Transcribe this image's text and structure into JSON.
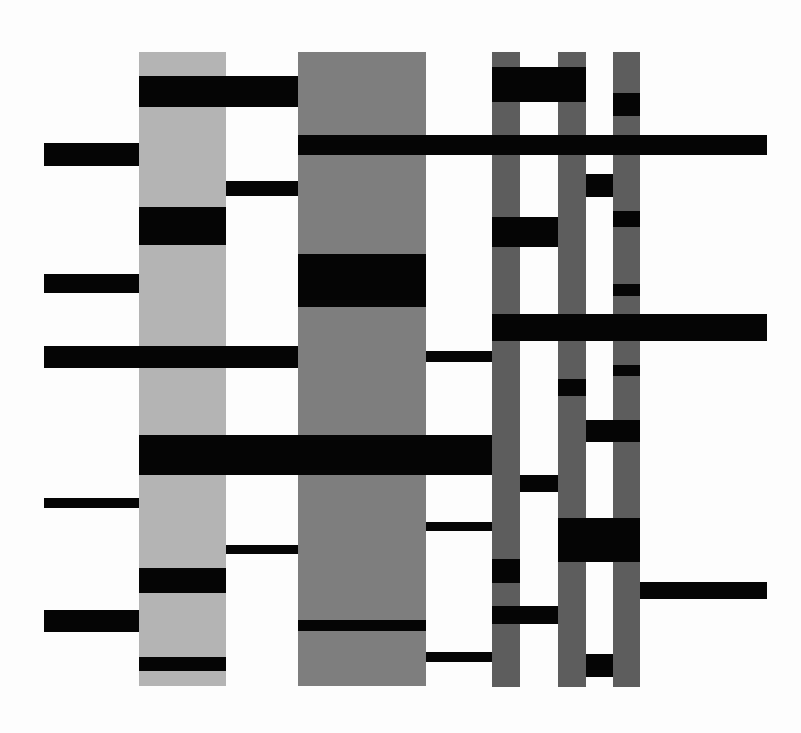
{
  "artwork": {
    "description": "Abstract geometric composition of vertical gray columns and horizontal black bars",
    "background": "#fdfdfd",
    "colors": {
      "light_gray": "#b4b4b4",
      "mid_gray": "#7e7e7e",
      "dark_gray": "#5d5d5d",
      "black": "#050505"
    },
    "columns": [
      {
        "name": "light-gray-column",
        "x": 139,
        "y": 52,
        "w": 87,
        "h": 634,
        "color": "#b4b4b4"
      },
      {
        "name": "mid-gray-column",
        "x": 298,
        "y": 52,
        "w": 128,
        "h": 634,
        "color": "#7e7e7e"
      },
      {
        "name": "narrow-column-a",
        "x": 492,
        "y": 52,
        "w": 28,
        "h": 635,
        "color": "#5d5d5d"
      },
      {
        "name": "narrow-column-b",
        "x": 558,
        "y": 52,
        "w": 28,
        "h": 635,
        "color": "#5d5d5d"
      },
      {
        "name": "narrow-column-c",
        "x": 613,
        "y": 52,
        "w": 27,
        "h": 635,
        "color": "#5d5d5d"
      }
    ],
    "bars": [
      {
        "x": 139,
        "y": 76,
        "w": 159,
        "h": 31
      },
      {
        "x": 492,
        "y": 67,
        "w": 94,
        "h": 35
      },
      {
        "x": 613,
        "y": 93,
        "w": 27,
        "h": 23
      },
      {
        "x": 44,
        "y": 143,
        "w": 95,
        "h": 23
      },
      {
        "x": 298,
        "y": 135,
        "w": 469,
        "h": 20
      },
      {
        "x": 226,
        "y": 181,
        "w": 72,
        "h": 15
      },
      {
        "x": 586,
        "y": 174,
        "w": 27,
        "h": 23
      },
      {
        "x": 139,
        "y": 207,
        "w": 87,
        "h": 38
      },
      {
        "x": 492,
        "y": 217,
        "w": 66,
        "h": 30
      },
      {
        "x": 613,
        "y": 211,
        "w": 27,
        "h": 16
      },
      {
        "x": 298,
        "y": 254,
        "w": 128,
        "h": 53
      },
      {
        "x": 44,
        "y": 274,
        "w": 95,
        "h": 19
      },
      {
        "x": 613,
        "y": 284,
        "w": 27,
        "h": 12
      },
      {
        "x": 492,
        "y": 314,
        "w": 275,
        "h": 27
      },
      {
        "x": 44,
        "y": 346,
        "w": 254,
        "h": 22
      },
      {
        "x": 426,
        "y": 351,
        "w": 66,
        "h": 11
      },
      {
        "x": 613,
        "y": 365,
        "w": 27,
        "h": 11
      },
      {
        "x": 558,
        "y": 379,
        "w": 28,
        "h": 17
      },
      {
        "x": 586,
        "y": 420,
        "w": 54,
        "h": 22
      },
      {
        "x": 139,
        "y": 435,
        "w": 353,
        "h": 40
      },
      {
        "x": 520,
        "y": 475,
        "w": 38,
        "h": 17
      },
      {
        "x": 44,
        "y": 498,
        "w": 95,
        "h": 10
      },
      {
        "x": 426,
        "y": 522,
        "w": 66,
        "h": 9
      },
      {
        "x": 558,
        "y": 518,
        "w": 82,
        "h": 44
      },
      {
        "x": 226,
        "y": 545,
        "w": 72,
        "h": 9
      },
      {
        "x": 492,
        "y": 559,
        "w": 28,
        "h": 24
      },
      {
        "x": 139,
        "y": 568,
        "w": 87,
        "h": 25
      },
      {
        "x": 640,
        "y": 582,
        "w": 127,
        "h": 17
      },
      {
        "x": 492,
        "y": 606,
        "w": 66,
        "h": 18
      },
      {
        "x": 44,
        "y": 610,
        "w": 95,
        "h": 22
      },
      {
        "x": 298,
        "y": 620,
        "w": 128,
        "h": 11
      },
      {
        "x": 426,
        "y": 652,
        "w": 66,
        "h": 10
      },
      {
        "x": 586,
        "y": 654,
        "w": 27,
        "h": 23
      },
      {
        "x": 139,
        "y": 657,
        "w": 87,
        "h": 14
      }
    ]
  }
}
